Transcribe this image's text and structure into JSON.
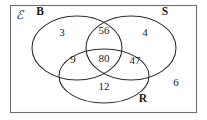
{
  "diagram": {
    "type": "venn-3-set",
    "universe": {
      "symbol": "ℰ",
      "outside_value": "6"
    },
    "sets": [
      {
        "key": "B",
        "label": "B",
        "label_x": 40,
        "label_y": 15
      },
      {
        "key": "S",
        "label": "S",
        "label_x": 165,
        "label_y": 15
      },
      {
        "key": "R",
        "label": "R",
        "label_x": 143,
        "label_y": 102
      }
    ],
    "regions": [
      {
        "key": "B_only",
        "value": "3",
        "x": 62,
        "y": 36
      },
      {
        "key": "B_and_S",
        "value": "56",
        "x": 104,
        "y": 34
      },
      {
        "key": "S_only",
        "value": "4",
        "x": 145,
        "y": 36
      },
      {
        "key": "B_and_R",
        "value": "9",
        "x": 73,
        "y": 63
      },
      {
        "key": "B_S_R",
        "value": "80",
        "x": 104,
        "y": 62
      },
      {
        "key": "S_and_R",
        "value": "47",
        "x": 135,
        "y": 64
      },
      {
        "key": "R_only",
        "value": "12",
        "x": 104,
        "y": 90
      },
      {
        "key": "outside",
        "value": "6",
        "x": 176,
        "y": 86
      }
    ],
    "colors": {
      "frame": "#6e6e6e",
      "circle": "#2b2b2b",
      "text": "#1a1a1a",
      "background": "#ffffff"
    }
  }
}
